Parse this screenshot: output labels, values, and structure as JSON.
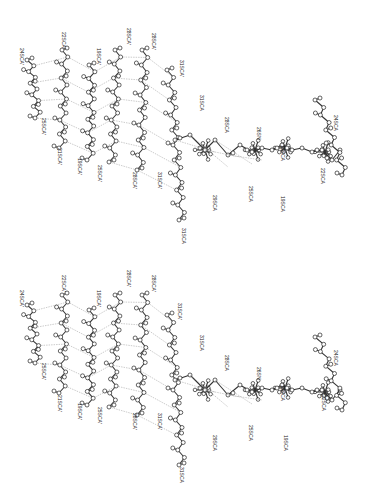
{
  "figure": {
    "type": "stereo-pair",
    "panels": [
      {
        "id": "top",
        "labels": [
          {
            "text": "24SCA'",
            "x": 20,
            "y": 48
          },
          {
            "text": "22SCA'",
            "x": 62,
            "y": 32
          },
          {
            "text": "19SCA'",
            "x": 97,
            "y": 48
          },
          {
            "text": "28SCA'",
            "x": 127,
            "y": 28
          },
          {
            "text": "28SCA'",
            "x": 152,
            "y": 33
          },
          {
            "text": "31SCA'",
            "x": 180,
            "y": 60
          },
          {
            "text": "25SCA'",
            "x": 42,
            "y": 118
          },
          {
            "text": "21SCA'",
            "x": 58,
            "y": 148
          },
          {
            "text": "19SCA'",
            "x": 78,
            "y": 158
          },
          {
            "text": "25SCA'",
            "x": 98,
            "y": 165
          },
          {
            "text": "28SCA'",
            "x": 133,
            "y": 172
          },
          {
            "text": "31SCA'",
            "x": 158,
            "y": 172
          },
          {
            "text": "31SCA",
            "x": 182,
            "y": 228
          },
          {
            "text": "31SCA",
            "x": 200,
            "y": 95
          },
          {
            "text": "28SCA",
            "x": 225,
            "y": 117
          },
          {
            "text": "26SN",
            "x": 257,
            "y": 127
          },
          {
            "text": "19SCA",
            "x": 281,
            "y": 145
          },
          {
            "text": "29SCA",
            "x": 213,
            "y": 195
          },
          {
            "text": "25SCA",
            "x": 249,
            "y": 186
          },
          {
            "text": "19SCA",
            "x": 281,
            "y": 196
          },
          {
            "text": "24SCA",
            "x": 334,
            "y": 115
          },
          {
            "text": "22SCA",
            "x": 321,
            "y": 168
          }
        ]
      },
      {
        "id": "bottom",
        "labels": [
          {
            "text": "24SCA'",
            "x": 20,
            "y": 45
          },
          {
            "text": "22SCA'",
            "x": 62,
            "y": 30
          },
          {
            "text": "19SCA'",
            "x": 97,
            "y": 45
          },
          {
            "text": "28SCA'",
            "x": 127,
            "y": 25
          },
          {
            "text": "28SCA'",
            "x": 152,
            "y": 30
          },
          {
            "text": "31SCA'",
            "x": 178,
            "y": 58
          },
          {
            "text": "25SCA'",
            "x": 42,
            "y": 118
          },
          {
            "text": "21SCA'",
            "x": 58,
            "y": 150
          },
          {
            "text": "19SCA'",
            "x": 78,
            "y": 158
          },
          {
            "text": "25SCA'",
            "x": 98,
            "y": 162
          },
          {
            "text": "28SCA'",
            "x": 133,
            "y": 168
          },
          {
            "text": "31SCA'",
            "x": 158,
            "y": 168
          },
          {
            "text": "31SCA",
            "x": 180,
            "y": 222
          },
          {
            "text": "31SCA",
            "x": 200,
            "y": 90
          },
          {
            "text": "28SCA",
            "x": 225,
            "y": 110
          },
          {
            "text": "26SN",
            "x": 257,
            "y": 122
          },
          {
            "text": "19SCA",
            "x": 281,
            "y": 140
          },
          {
            "text": "29SCA",
            "x": 213,
            "y": 190
          },
          {
            "text": "25SCA",
            "x": 249,
            "y": 180
          },
          {
            "text": "19SCA",
            "x": 284,
            "y": 190
          },
          {
            "text": "24SCA",
            "x": 334,
            "y": 105
          },
          {
            "text": "22SCA",
            "x": 322,
            "y": 150
          }
        ]
      }
    ]
  }
}
